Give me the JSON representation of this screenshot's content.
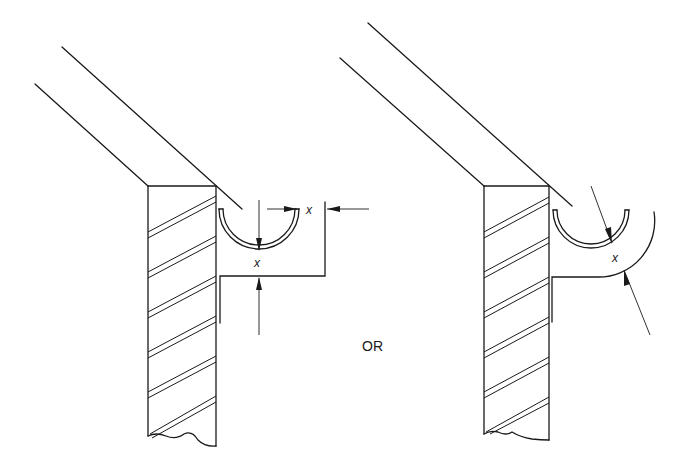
{
  "diagram": {
    "separator_label": "OR",
    "left_panel": {
      "name": "square fascia arrangement",
      "dimension_labels": [
        "x",
        "x"
      ],
      "components": [
        "roof slope",
        "hatched wall",
        "half-round gutter",
        "rectangular fascia board",
        "vertical dimension x",
        "horizontal dimension x"
      ]
    },
    "right_panel": {
      "name": "curved fascia arrangement",
      "dimension_labels": [
        "x"
      ],
      "components": [
        "roof slope",
        "hatched wall",
        "half-round gutter",
        "curved fascia board",
        "radial dimension x"
      ]
    },
    "colors": {
      "line": "#1a1a1a",
      "background": "#ffffff"
    }
  }
}
